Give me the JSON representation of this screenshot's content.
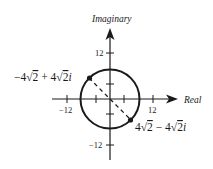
{
  "diagram": {
    "type": "complex-plane",
    "axes": {
      "x_label": "Real",
      "y_label": "Imaginary",
      "x_ticks": [
        {
          "value": -12,
          "label": "-12"
        },
        {
          "value": -4,
          "label": ""
        },
        {
          "value": 4,
          "label": ""
        },
        {
          "value": 12,
          "label": "12"
        }
      ],
      "y_ticks": [
        {
          "value": 12,
          "label": "12"
        },
        {
          "value": 4,
          "label": ""
        },
        {
          "value": -4,
          "label": ""
        },
        {
          "value": -12,
          "label": "-12"
        }
      ],
      "x_tick_neg_label": "−12",
      "x_tick_pos_label": "12",
      "y_tick_pos_label": "12",
      "y_tick_neg_label": "−12"
    },
    "circle": {
      "center": [
        0,
        0
      ],
      "radius": 8
    },
    "points": [
      {
        "label_prefix": "−4",
        "label_mid": "2 + 4",
        "label_suffix": "2i",
        "full": "-4√2 + 4√2i",
        "re": -5.657,
        "im": 5.657
      },
      {
        "label_prefix": "4",
        "label_mid": "2 − 4",
        "label_suffix": "2i",
        "full": "4√2 - 4√2i",
        "re": 5.657,
        "im": -5.657
      }
    ],
    "dashed_segment": "diameter connecting the two points through origin",
    "colors": {
      "ink": "#1a1a1a",
      "background": "#ffffff"
    }
  }
}
